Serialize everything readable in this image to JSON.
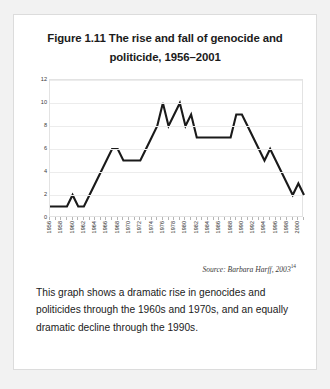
{
  "figure": {
    "title": "Figure 1.11 The rise and fall of genocide and politicide, 1956–2001",
    "source_text": "Source: Barbara Harff, 2003",
    "source_superscript": "14",
    "caption": "This graph shows a dramatic rise in genocides and politicides through the 1960s and 1970s, and an equally dramatic decline through the 1990s."
  },
  "chart_data": {
    "type": "line",
    "title": "Figure 1.11 The rise and fall of genocide and politicide, 1956–2001",
    "xlabel": "",
    "ylabel": "",
    "ylim": [
      0,
      12
    ],
    "yticks": [
      0,
      2,
      4,
      6,
      8,
      10,
      12
    ],
    "grid": true,
    "legend": null,
    "line_color": "#1a1a1a",
    "x": [
      1956,
      1957,
      1958,
      1959,
      1960,
      1961,
      1962,
      1963,
      1964,
      1965,
      1966,
      1967,
      1968,
      1969,
      1970,
      1971,
      1972,
      1973,
      1974,
      1975,
      1976,
      1977,
      1978,
      1979,
      1980,
      1981,
      1982,
      1983,
      1984,
      1985,
      1986,
      1987,
      1988,
      1989,
      1990,
      1991,
      1992,
      1993,
      1994,
      1995,
      1996,
      1997,
      1998,
      1999,
      2000,
      2001
    ],
    "values": [
      1,
      1,
      1,
      1,
      2,
      1,
      1,
      2,
      3,
      4,
      5,
      6,
      6,
      5,
      5,
      5,
      5,
      6,
      7,
      8,
      10,
      8,
      9,
      10,
      8,
      9,
      7,
      7,
      7,
      7,
      7,
      7,
      7,
      9,
      9,
      8,
      7,
      6,
      5,
      6,
      5,
      4,
      3,
      2,
      3,
      2
    ],
    "xtick_labels": [
      "1956",
      "1958",
      "1960",
      "1962",
      "1964",
      "1966",
      "1968",
      "1970",
      "1972",
      "1974",
      "1976",
      "1978",
      "1980",
      "1982",
      "1984",
      "1986",
      "1988",
      "1990",
      "1992",
      "1994",
      "1996",
      "1998",
      "2000"
    ],
    "xtick_years": [
      1956,
      1958,
      1960,
      1962,
      1964,
      1966,
      1968,
      1970,
      1972,
      1974,
      1976,
      1978,
      1980,
      1982,
      1984,
      1986,
      1988,
      1990,
      1992,
      1994,
      1996,
      1998,
      2000
    ]
  }
}
